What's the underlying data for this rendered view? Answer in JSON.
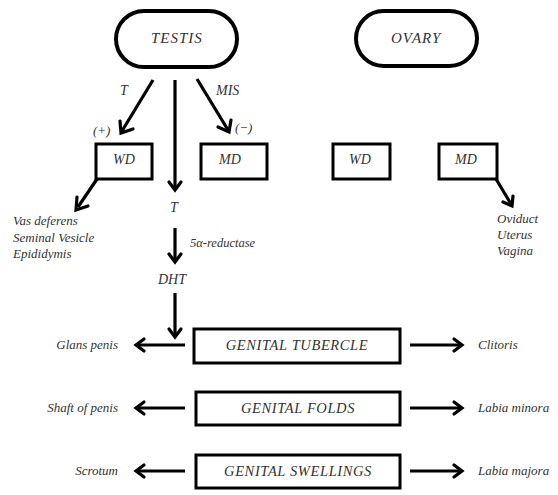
{
  "diagram": {
    "type": "sexual-differentiation-flowchart",
    "gonads": {
      "male": "TESTIS",
      "female": "OVARY"
    },
    "male_branch": {
      "left_hormone": "T",
      "left_effect": "(+)",
      "right_hormone": "MIS",
      "right_effect": "(−)",
      "center_hormone": "T",
      "enzyme": "5α-reductase",
      "converted_hormone": "DHT"
    },
    "ducts": {
      "male_wolffian": "WD",
      "male_mullerian": "MD",
      "female_wolffian": "WD",
      "female_mullerian": "MD"
    },
    "wolffian_derivatives": [
      "Vas deferens",
      "Seminal Vesicle",
      "Epididymis"
    ],
    "mullerian_derivatives": [
      "Oviduct",
      "Uterus",
      "Vagina"
    ],
    "external_structures": [
      {
        "primordium": "GENITAL TUBERCLE",
        "male": "Glans penis",
        "female": "Clitoris"
      },
      {
        "primordium": "GENITAL FOLDS",
        "male": "Shaft of penis",
        "female": "Labia minora"
      },
      {
        "primordium": "GENITAL SWELLINGS",
        "male": "Scrotum",
        "female": "Labia majora"
      }
    ]
  }
}
